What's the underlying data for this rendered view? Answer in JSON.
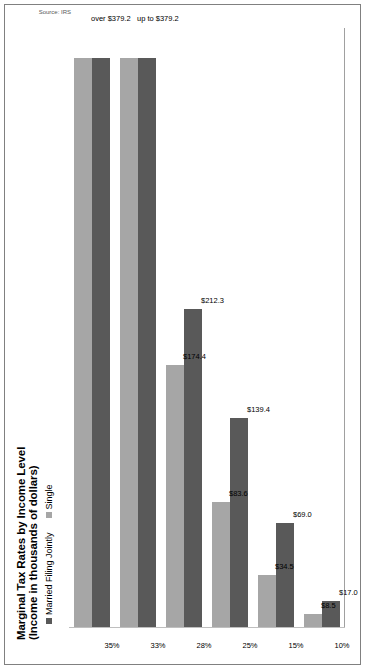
{
  "chart_data": {
    "type": "bar",
    "title": "Marginal Tax Rates by Income Level",
    "subtitle": "(Income in thousands of dollars)",
    "orientation": "horizontal-rotated",
    "xlabel": "",
    "ylabel": "",
    "grid": false,
    "legend_position": "top-left",
    "categories": [
      "10%",
      "15%",
      "25%",
      "28%",
      "33%",
      "35%"
    ],
    "bracket_labels": [
      "",
      "",
      "",
      "",
      "up to $379.2",
      "over $379.2"
    ],
    "series": [
      {
        "name": "Married Filing Jointly",
        "color": "#595959",
        "values": [
          17.0,
          69.0,
          139.4,
          212.3,
          379.2,
          379.2
        ],
        "labels": [
          "$17.0",
          "$69.0",
          "$139.4",
          "$212.3",
          "",
          ""
        ]
      },
      {
        "name": "Single",
        "color": "#a6a6a6",
        "values": [
          8.5,
          34.5,
          83.6,
          174.4,
          379.2,
          379.2
        ],
        "labels": [
          "$8.5",
          "$34.5",
          "$83.6",
          "$174.4",
          "",
          ""
        ]
      }
    ],
    "ylim": [
      0,
      400
    ],
    "source": "Source: IRS"
  },
  "legend": {
    "items": [
      {
        "label": "Married Filing Jointly",
        "color": "#595959"
      },
      {
        "label": "Single",
        "color": "#a6a6a6"
      }
    ]
  }
}
